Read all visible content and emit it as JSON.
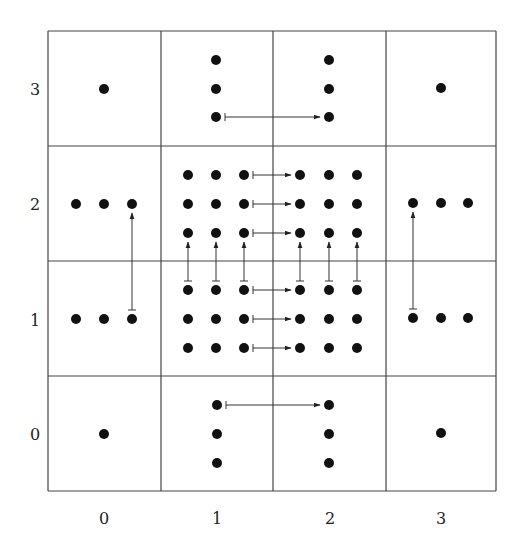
{
  "diagram": {
    "type": "grid-point-transfer",
    "grid": {
      "rows": 4,
      "cols": 4,
      "x_lines": [
        48,
        161,
        273,
        386,
        496
      ],
      "y_lines": [
        31,
        146,
        261,
        376,
        491
      ],
      "line_color": "#444444"
    },
    "x_axis_labels": [
      {
        "text": "0",
        "x": 104
      },
      {
        "text": "1",
        "x": 217
      },
      {
        "text": "2",
        "x": 330
      },
      {
        "text": "3",
        "x": 441
      }
    ],
    "y_axis_labels": [
      {
        "text": "3",
        "y": 89
      },
      {
        "text": "2",
        "y": 204
      },
      {
        "text": "1",
        "y": 320
      },
      {
        "text": "0",
        "y": 434
      }
    ],
    "dot_color": "#111111",
    "dots": [
      [
        104,
        89
      ],
      [
        216,
        60
      ],
      [
        216,
        89
      ],
      [
        216,
        117
      ],
      [
        329,
        60
      ],
      [
        329,
        89
      ],
      [
        329,
        117
      ],
      [
        441,
        88
      ],
      [
        76,
        204
      ],
      [
        104,
        204
      ],
      [
        132,
        204
      ],
      [
        188,
        175
      ],
      [
        216,
        175
      ],
      [
        244,
        175
      ],
      [
        300,
        175
      ],
      [
        329,
        175
      ],
      [
        357,
        175
      ],
      [
        188,
        204
      ],
      [
        216,
        204
      ],
      [
        244,
        204
      ],
      [
        300,
        204
      ],
      [
        329,
        204
      ],
      [
        357,
        204
      ],
      [
        188,
        233
      ],
      [
        216,
        233
      ],
      [
        244,
        233
      ],
      [
        300,
        233
      ],
      [
        329,
        233
      ],
      [
        357,
        233
      ],
      [
        413,
        203
      ],
      [
        441,
        203
      ],
      [
        468,
        203
      ],
      [
        76,
        319
      ],
      [
        104,
        319
      ],
      [
        132,
        319
      ],
      [
        188,
        290
      ],
      [
        216,
        290
      ],
      [
        244,
        290
      ],
      [
        300,
        290
      ],
      [
        329,
        290
      ],
      [
        357,
        290
      ],
      [
        188,
        319
      ],
      [
        216,
        319
      ],
      [
        244,
        319
      ],
      [
        300,
        319
      ],
      [
        329,
        319
      ],
      [
        357,
        319
      ],
      [
        188,
        348
      ],
      [
        216,
        348
      ],
      [
        244,
        348
      ],
      [
        300,
        348
      ],
      [
        329,
        348
      ],
      [
        357,
        348
      ],
      [
        413,
        318
      ],
      [
        441,
        318
      ],
      [
        468,
        318
      ],
      [
        104,
        434
      ],
      [
        217,
        405
      ],
      [
        217,
        434
      ],
      [
        217,
        463
      ],
      [
        329,
        405
      ],
      [
        329,
        434
      ],
      [
        329,
        463
      ],
      [
        441,
        433
      ]
    ],
    "arrows_horizontal": [
      {
        "x1": 225,
        "x2": 320,
        "y": 117
      },
      {
        "x1": 253,
        "x2": 291,
        "y": 175
      },
      {
        "x1": 253,
        "x2": 291,
        "y": 204
      },
      {
        "x1": 253,
        "x2": 291,
        "y": 233
      },
      {
        "x1": 253,
        "x2": 291,
        "y": 290
      },
      {
        "x1": 253,
        "x2": 291,
        "y": 319
      },
      {
        "x1": 253,
        "x2": 291,
        "y": 348
      },
      {
        "x1": 226,
        "x2": 320,
        "y": 405
      }
    ],
    "arrows_vertical": [
      {
        "x": 132,
        "y1": 310,
        "y2": 213
      },
      {
        "x": 188,
        "y1": 281,
        "y2": 242
      },
      {
        "x": 216,
        "y1": 281,
        "y2": 242
      },
      {
        "x": 244,
        "y1": 281,
        "y2": 242
      },
      {
        "x": 300,
        "y1": 281,
        "y2": 242
      },
      {
        "x": 329,
        "y1": 281,
        "y2": 242
      },
      {
        "x": 357,
        "y1": 281,
        "y2": 242
      },
      {
        "x": 413,
        "y1": 309,
        "y2": 212
      }
    ]
  }
}
